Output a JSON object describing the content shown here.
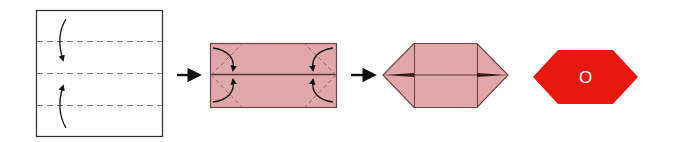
{
  "diagram": {
    "colors": {
      "paper_white": "#ffffff",
      "outline": "#2b2b2b",
      "crease_dash": "#7a7a7a",
      "paper_pink": "#e2a7a9",
      "pink_outline": "#6e4446",
      "pink_crease": "#9a6a6c",
      "arrow": "#111111",
      "result_red": "#e8180e",
      "result_label": "#ffffff"
    },
    "steps": [
      {
        "id": "step-1",
        "description": "Square paper with three horizontal valley-fold creases; top and bottom edges folded to center"
      },
      {
        "id": "step-2",
        "description": "Pink rectangle folded in half-width; four corners folded to center line"
      },
      {
        "id": "step-3",
        "description": "Elongated hexagon shape with triangular pointed ends"
      },
      {
        "id": "step-4",
        "description": "Finished red hexagon piece"
      }
    ],
    "connectors": [
      {
        "id": "arrow-1",
        "direction": "right"
      },
      {
        "id": "arrow-2",
        "direction": "right"
      }
    ],
    "result": {
      "label": "O"
    }
  }
}
